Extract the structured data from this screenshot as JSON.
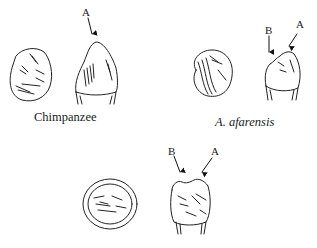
{
  "figure": {
    "panels": [
      {
        "id": "chimpanzee",
        "caption": "Chimpanzee",
        "caption_style": "roman",
        "arrows": [
          {
            "letter": "A"
          }
        ]
      },
      {
        "id": "a-afarensis",
        "caption": "A. afarensis",
        "caption_style": "italic",
        "arrows": [
          {
            "letter": "B"
          },
          {
            "letter": "A"
          }
        ]
      },
      {
        "id": "human",
        "caption": "",
        "caption_style": "roman",
        "arrows": [
          {
            "letter": "B"
          },
          {
            "letter": "A"
          }
        ]
      }
    ]
  }
}
